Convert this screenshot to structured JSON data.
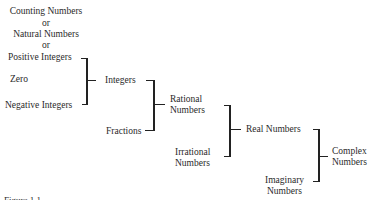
{
  "diagram": {
    "nodes": {
      "counting": "Counting Numbers",
      "or1": "or",
      "natural": "Natural Numbers",
      "or2": "or",
      "positive": "Positive Integers",
      "zero": "Zero",
      "negative": "Negative Integers",
      "integers": "Integers",
      "fractions": "Fractions",
      "rational_1": "Rational",
      "rational_2": "Numbers",
      "irrational_1": "Irrational",
      "irrational_2": "Numbers",
      "real": "Real Numbers",
      "imaginary_1": "Imaginary",
      "imaginary_2": "Numbers",
      "complex_1": "Complex",
      "complex_2": "Numbers"
    },
    "caption": "Figure 1.1"
  }
}
